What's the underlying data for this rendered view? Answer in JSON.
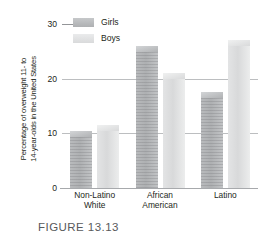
{
  "figure": {
    "caption": "FIGURE 13.13",
    "ylabel_line1": "Percentage of overweight 11- to",
    "ylabel_line2": "14-year-olds in the United States"
  },
  "legend": {
    "items": [
      {
        "label": "Girls",
        "color": "#b2b4b6",
        "swatch": "girls"
      },
      {
        "label": "Boys",
        "color": "#dedfe0",
        "swatch": "boys"
      }
    ]
  },
  "axis": {
    "yticks": [
      "0",
      "10",
      "20",
      "30"
    ],
    "ymin": 0,
    "ymax": 30
  },
  "categories": [
    {
      "line1": "Non-Latino",
      "line2": "White"
    },
    {
      "line1": "African",
      "line2": "American"
    },
    {
      "line1": "Latino",
      "line2": ""
    }
  ],
  "chart_data": {
    "type": "bar",
    "title": "",
    "subtitle": "",
    "xlabel": "",
    "ylabel": "Percentage of overweight 11- to 14-year-olds in the United States",
    "categories": [
      "Non-Latino White",
      "African American",
      "Latino"
    ],
    "series": [
      {
        "name": "Girls",
        "values": [
          10.5,
          26,
          17.5
        ],
        "color": "#b2b4b6"
      },
      {
        "name": "Boys",
        "values": [
          11.5,
          21,
          27
        ],
        "color": "#dedfe0"
      }
    ],
    "ylim": [
      0,
      30
    ],
    "yticks": [
      0,
      10,
      20,
      30
    ],
    "grid": true,
    "legend_position": "top-left"
  }
}
